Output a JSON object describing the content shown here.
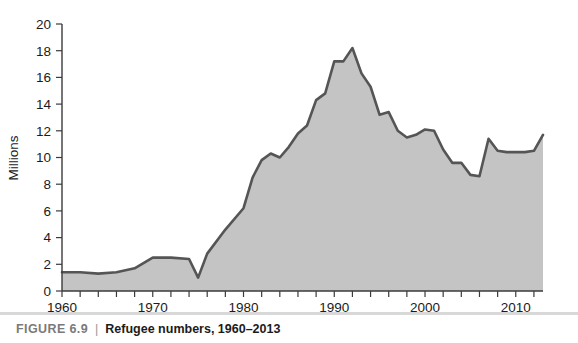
{
  "caption": {
    "figure_label": "FIGURE 6.9",
    "divider": "|",
    "title": "Refugee numbers, 1960–2013"
  },
  "colors": {
    "area_fill": "#c4c4c4",
    "line": "#555555",
    "axis": "#3b3b3b",
    "text": "#1b1b1b",
    "caption_label": "#7a7a7a",
    "caption_rule": "#d8d8d8",
    "background": "#ffffff"
  },
  "chart_data": {
    "type": "area",
    "title": "Refugee numbers, 1960–2013",
    "xlabel": "",
    "ylabel": "Millions",
    "xlim": [
      1960,
      2013
    ],
    "ylim": [
      0,
      20
    ],
    "grid": false,
    "legend": null,
    "y_ticks": [
      0,
      2,
      4,
      6,
      8,
      10,
      12,
      14,
      16,
      18,
      20
    ],
    "y_tick_labels": [
      "0",
      "2",
      "4",
      "6",
      "8",
      "10",
      "12",
      "14",
      "16",
      "18",
      "20"
    ],
    "x_tick_step": 2,
    "x_ticks": [
      1960,
      1962,
      1964,
      1966,
      1968,
      1970,
      1972,
      1974,
      1976,
      1978,
      1980,
      1982,
      1984,
      1986,
      1988,
      1990,
      1992,
      1994,
      1996,
      1998,
      2000,
      2002,
      2004,
      2006,
      2008,
      2010,
      2012
    ],
    "x_labeled_ticks": [
      1960,
      1970,
      1980,
      1990,
      2000,
      2010
    ],
    "x_tick_labels": [
      "1960",
      "1970",
      "1980",
      "1990",
      "2000",
      "2010"
    ],
    "x": [
      1960,
      1962,
      1964,
      1966,
      1968,
      1970,
      1972,
      1974,
      1975,
      1976,
      1978,
      1980,
      1981,
      1982,
      1983,
      1984,
      1985,
      1986,
      1987,
      1988,
      1989,
      1990,
      1991,
      1992,
      1993,
      1994,
      1995,
      1996,
      1997,
      1998,
      1999,
      2000,
      2001,
      2002,
      2003,
      2004,
      2005,
      2006,
      2007,
      2008,
      2009,
      2010,
      2011,
      2012,
      2013
    ],
    "values": [
      1.4,
      1.4,
      1.3,
      1.4,
      1.7,
      2.5,
      2.5,
      2.4,
      1.0,
      2.8,
      4.6,
      6.2,
      8.5,
      9.8,
      10.3,
      10.0,
      10.8,
      11.8,
      12.4,
      14.3,
      14.8,
      17.2,
      17.2,
      18.2,
      16.3,
      15.3,
      13.2,
      13.4,
      12.0,
      11.5,
      11.7,
      12.1,
      12.0,
      10.6,
      9.6,
      9.6,
      8.7,
      8.6,
      11.4,
      10.5,
      10.4,
      10.4,
      10.4,
      10.5,
      11.7
    ],
    "notes": {
      "peak": {
        "year": 1992,
        "value": 18.2
      },
      "min_early": {
        "year": 1975,
        "value": 1.0
      },
      "dip_2006": {
        "year": 2006,
        "value": 8.6
      },
      "end": {
        "year": 2013,
        "value": 11.7
      }
    }
  }
}
